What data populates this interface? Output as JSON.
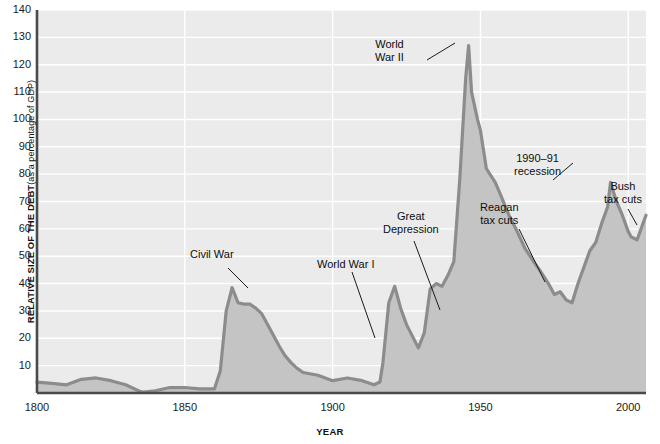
{
  "chart_data": {
    "type": "area",
    "title": "",
    "xlabel": "YEAR",
    "ylabel": "RELATIVE SIZE OF THE DEBT",
    "ylabel_sub": "(as a percentage of GDP)",
    "xlim": [
      1800,
      2006
    ],
    "ylim": [
      0,
      140
    ],
    "grid": true,
    "legend": "none",
    "yticks": [
      140,
      130,
      120,
      110,
      100,
      90,
      80,
      70,
      60,
      50,
      40,
      30,
      20,
      10
    ],
    "xticks": [
      1800,
      1850,
      1900,
      1950,
      2000
    ],
    "series": [
      {
        "name": "Federal debt as percentage of GDP",
        "line_color": "#8c8c8c",
        "fill_color": "#c4c4c4",
        "x": [
          1800,
          1805,
          1810,
          1815,
          1820,
          1825,
          1830,
          1835,
          1836,
          1840,
          1845,
          1850,
          1855,
          1860,
          1862,
          1864,
          1866,
          1868,
          1870,
          1872,
          1874,
          1876,
          1878,
          1880,
          1882,
          1884,
          1886,
          1888,
          1890,
          1895,
          1900,
          1905,
          1910,
          1914,
          1916,
          1917,
          1919,
          1921,
          1923,
          1925,
          1929,
          1931,
          1933,
          1935,
          1937,
          1939,
          1941,
          1943,
          1945,
          1946,
          1947,
          1949,
          1950,
          1952,
          1955,
          1957,
          1960,
          1962,
          1965,
          1968,
          1970,
          1973,
          1975,
          1977,
          1979,
          1981,
          1983,
          1985,
          1987,
          1989,
          1991,
          1993,
          1994,
          1996,
          1998,
          2000,
          2001,
          2003,
          2005,
          2006
        ],
        "y": [
          4.0,
          3.5,
          3.0,
          5.0,
          5.5,
          4.5,
          3.0,
          0.5,
          0.3,
          0.8,
          2.0,
          2.0,
          1.5,
          1.5,
          8.0,
          30.0,
          38.5,
          33.0,
          32.5,
          32.5,
          31.0,
          29.0,
          25.0,
          21.0,
          17.0,
          13.5,
          11.0,
          9.0,
          7.5,
          6.5,
          4.5,
          5.5,
          4.5,
          3.0,
          4.0,
          11.0,
          33.0,
          39.0,
          31.0,
          25.0,
          16.5,
          22.0,
          38.0,
          40.0,
          39.0,
          43.0,
          48.0,
          78.0,
          115.0,
          127.0,
          110.0,
          100.0,
          96.0,
          82.0,
          77.0,
          72.0,
          64.0,
          60.0,
          53.0,
          48.0,
          45.0,
          40.0,
          36.0,
          37.0,
          34.0,
          33.0,
          40.0,
          46.0,
          52.0,
          55.0,
          62.0,
          68.0,
          77.0,
          70.0,
          65.0,
          59.0,
          57.0,
          56.0,
          62.0,
          65.0
        ]
      }
    ],
    "annotations": [
      {
        "id": "civil-war",
        "label": "Civil War",
        "align": "left",
        "x_px": 190,
        "y_px": 248,
        "leader": [
          [
            228,
            268
          ],
          [
            248,
            288
          ]
        ]
      },
      {
        "id": "world-war-1",
        "label": "World War I",
        "align": "left",
        "x_px": 317,
        "y_px": 258,
        "leader": [
          [
            352,
            272
          ],
          [
            375,
            338
          ]
        ]
      },
      {
        "id": "great-depression",
        "label": "Great\nDepression",
        "align": "center",
        "x_px": 383,
        "y_px": 210,
        "leader": [
          [
            414,
            241
          ],
          [
            440,
            310
          ]
        ]
      },
      {
        "id": "world-war-2",
        "label": "World\nWar II",
        "align": "center",
        "x_px": 375,
        "y_px": 38,
        "leader": [
          [
            427,
            60
          ],
          [
            455,
            43
          ]
        ]
      },
      {
        "id": "recession-1990-91",
        "label": "1990–91\nrecession",
        "align": "center",
        "x_px": 514,
        "y_px": 152,
        "leader": [
          [
            553,
            180
          ],
          [
            573,
            163
          ]
        ]
      },
      {
        "id": "reagan-tax-cuts",
        "label": "Reagan\ntax cuts",
        "align": "center",
        "x_px": 480,
        "y_px": 201,
        "leader": [
          [
            519,
            229
          ],
          [
            545,
            282
          ]
        ]
      },
      {
        "id": "bush-tax-cuts",
        "label": "Bush\ntax cuts",
        "align": "center",
        "x_px": 604,
        "y_px": 180,
        "leader": [
          [
            628,
            209
          ],
          [
            637,
            225
          ]
        ]
      }
    ],
    "colors": {
      "plot_background": "#ebebeb",
      "gridline": "#ffffff",
      "axis": "#4a4a4a",
      "line": "#8c8c8c",
      "fill": "#c4c4c4",
      "text": "#111111"
    }
  }
}
